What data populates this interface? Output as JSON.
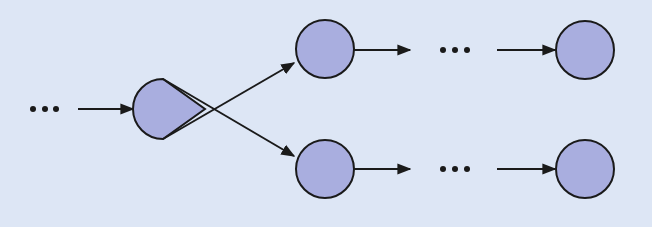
{
  "diagram": {
    "colors": {
      "background": "#dde6f5",
      "node_fill": "#a9aedf",
      "stroke": "#1a1a1a"
    },
    "ellipsis_label": "…",
    "nodes": [
      {
        "id": "split",
        "shape": "teardrop",
        "cx": 165,
        "cy": 109
      },
      {
        "id": "top-1",
        "shape": "circle",
        "cx": 325,
        "cy": 49,
        "r": 29
      },
      {
        "id": "bottom-1",
        "shape": "circle",
        "cx": 325,
        "cy": 169,
        "r": 29
      },
      {
        "id": "top-n",
        "shape": "circle",
        "cx": 585,
        "cy": 50,
        "r": 29
      },
      {
        "id": "bottom-n",
        "shape": "circle",
        "cx": 585,
        "cy": 169,
        "r": 29
      }
    ],
    "ellipses": [
      {
        "id": "left",
        "x": [
          33,
          45,
          56
        ],
        "y": 109
      },
      {
        "id": "top",
        "x": [
          443,
          455,
          467
        ],
        "y": 50
      },
      {
        "id": "bottom",
        "x": [
          443,
          455,
          467
        ],
        "y": 169
      }
    ],
    "edges": [
      {
        "from": "ellipsis-left",
        "to": "split"
      },
      {
        "from": "split",
        "to": "top-1"
      },
      {
        "from": "split",
        "to": "bottom-1"
      },
      {
        "from": "top-1",
        "to": "ellipsis-top"
      },
      {
        "from": "ellipsis-top",
        "to": "top-n"
      },
      {
        "from": "bottom-1",
        "to": "ellipsis-bottom"
      },
      {
        "from": "ellipsis-bottom",
        "to": "bottom-n"
      }
    ]
  }
}
